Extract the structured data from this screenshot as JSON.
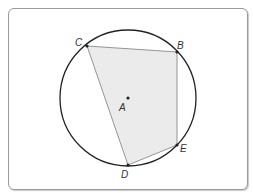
{
  "diagram": {
    "type": "inscribed-polygon-in-circle",
    "circle": {
      "center_label": "A",
      "cx": 128,
      "cy": 98,
      "r": 68,
      "stroke": "#222222"
    },
    "polygon": {
      "vertices_order": [
        "C",
        "B",
        "E",
        "D"
      ],
      "fill": "#ebebeb",
      "stroke": "#8a8a8a"
    },
    "points": {
      "A": {
        "label": "A",
        "x": 128,
        "y": 98
      },
      "B": {
        "label": "B",
        "x": 177,
        "y": 52
      },
      "C": {
        "label": "C",
        "x": 87,
        "y": 46
      },
      "D": {
        "label": "D",
        "x": 128,
        "y": 165
      },
      "E": {
        "label": "E",
        "x": 177,
        "y": 145
      }
    }
  }
}
